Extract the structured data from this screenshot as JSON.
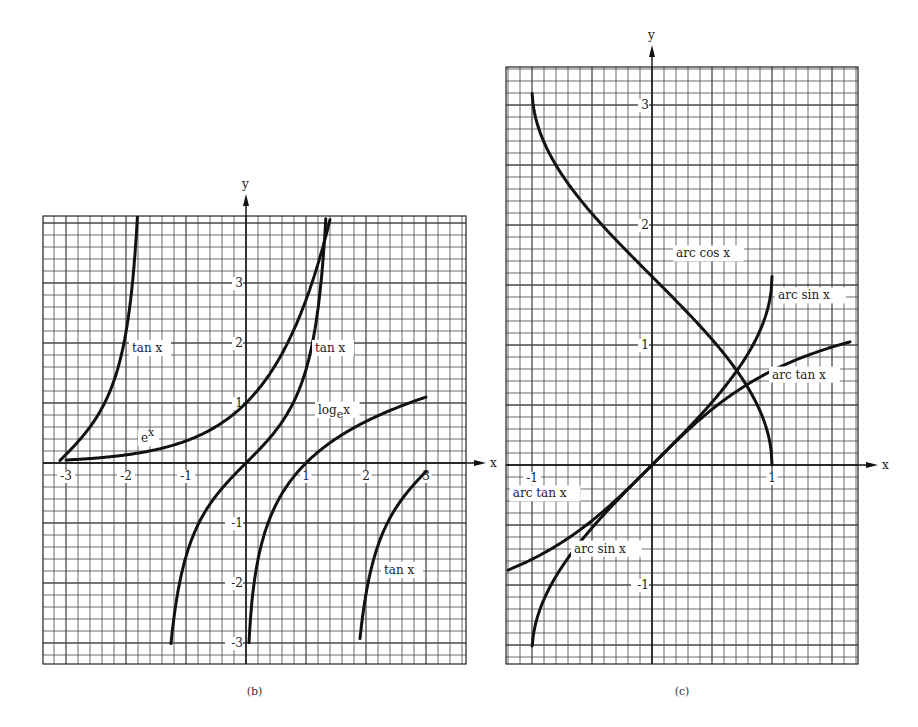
{
  "chart_data": [
    {
      "id": "b",
      "type": "line",
      "caption": "(b)",
      "xlabel": "x",
      "ylabel": "y",
      "xlim": [
        -3.4,
        3.7
      ],
      "ylim": [
        -3.35,
        4.1
      ],
      "grid": true,
      "grid_step": 0.2,
      "x_ticks": [
        {
          "v": -3,
          "label": "-3"
        },
        {
          "v": -2,
          "label": "-2"
        },
        {
          "v": -1,
          "label": "-1"
        },
        {
          "v": 1,
          "label": "1"
        },
        {
          "v": 2,
          "label": "2"
        },
        {
          "v": 3,
          "label": "3"
        }
      ],
      "y_ticks": [
        {
          "v": 3,
          "label": "3"
        },
        {
          "v": 2,
          "label": "2"
        },
        {
          "v": 1,
          "label": "1"
        },
        {
          "v": -1,
          "label": "-1"
        },
        {
          "v": -2,
          "label": "-2"
        },
        {
          "v": -3,
          "label": "-3"
        }
      ],
      "series": [
        {
          "name": "tan x",
          "fn": "tan",
          "domain": [
            -3.1,
            -1.72
          ]
        },
        {
          "name": "tan x",
          "fn": "tan",
          "domain": [
            -1.25,
            1.33
          ]
        },
        {
          "name": "tan x",
          "fn": "tan",
          "domain": [
            1.9,
            3.0
          ]
        },
        {
          "name": "e^x",
          "fn": "exp",
          "domain": [
            -3.0,
            1.4
          ]
        },
        {
          "name": "log_e x",
          "fn": "log",
          "domain": [
            0.05,
            3.0
          ]
        }
      ],
      "annotations": [
        {
          "text": "tan x",
          "x": -1.9,
          "y": 1.85
        },
        {
          "text": "tan x",
          "x": 1.15,
          "y": 1.85
        },
        {
          "text": "tan x",
          "x": 2.3,
          "y": -1.85
        },
        {
          "text": "e",
          "sup": "x",
          "x": -1.75,
          "y": 0.35
        },
        {
          "text": "log",
          "sub": "e",
          "tail": "x",
          "x": 1.2,
          "y": 0.82
        }
      ],
      "layout": {
        "ox": 246,
        "oy": 463,
        "unit": 60,
        "left": 43,
        "top": 216,
        "right": 466,
        "bottom": 664
      }
    },
    {
      "id": "c",
      "type": "line",
      "caption": "(c)",
      "xlabel": "x",
      "ylabel": "y",
      "xlim": [
        -1.2,
        1.72
      ],
      "ylim": [
        -1.66,
        3.3
      ],
      "grid": true,
      "grid_step": 0.1,
      "x_ticks": [
        {
          "v": -1,
          "label": "-1"
        },
        {
          "v": 1,
          "label": "1"
        }
      ],
      "y_ticks": [
        {
          "v": 3,
          "label": "3"
        },
        {
          "v": 2,
          "label": "2"
        },
        {
          "v": 1,
          "label": "1"
        },
        {
          "v": -1,
          "label": "-1"
        }
      ],
      "series": [
        {
          "name": "arc cos x",
          "fn": "acos",
          "domain": [
            -0.999,
            1.0
          ]
        },
        {
          "name": "arc sin x",
          "fn": "asin",
          "domain": [
            -0.998,
            1.0
          ]
        },
        {
          "name": "arc tan x",
          "fn": "atan",
          "domain": [
            -1.2,
            1.65
          ]
        }
      ],
      "annotations": [
        {
          "text": "arc cos x",
          "x": 0.2,
          "y": 1.73
        },
        {
          "text": "arc sin x",
          "x": 1.05,
          "y": 1.38
        },
        {
          "text": "arc tan x",
          "x": 1.0,
          "y": 0.72
        },
        {
          "text": "arc tan x",
          "x": -1.16,
          "y": -0.27
        },
        {
          "text": "arc sin x",
          "x": -0.65,
          "y": -0.73
        }
      ],
      "layout": {
        "ox": 652,
        "oy": 465,
        "unit": 120,
        "left": 506,
        "top": 67,
        "right": 858,
        "bottom": 664
      }
    }
  ]
}
